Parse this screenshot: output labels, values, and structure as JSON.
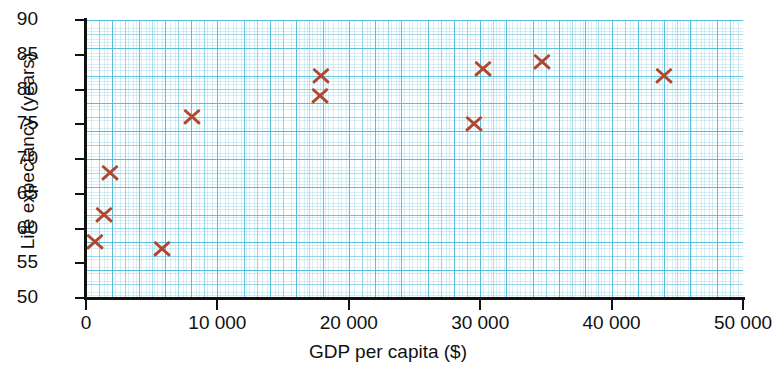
{
  "chart_data": {
    "type": "scatter",
    "title": "",
    "xlabel": "GDP per capita ($)",
    "ylabel": "Life expectancy (years)",
    "xlim": [
      0,
      50000
    ],
    "ylim": [
      50,
      90
    ],
    "xticks": [
      0,
      10000,
      20000,
      30000,
      40000,
      50000
    ],
    "xtick_labels": [
      "0",
      "10 000",
      "20 000",
      "30 000",
      "40 000",
      "50 000"
    ],
    "yticks": [
      50,
      55,
      60,
      65,
      70,
      75,
      80,
      85,
      90
    ],
    "ytick_labels": [
      "50",
      "55",
      "60",
      "65",
      "70",
      "75",
      "80",
      "85",
      "90"
    ],
    "grid": true,
    "grid_style": "graph-paper",
    "legend": null,
    "marker": "x",
    "marker_color": "#b1472f",
    "grid_color": "#6fc3da",
    "axis_color": "#111111",
    "points": [
      {
        "x": 700,
        "y": 58
      },
      {
        "x": 1400,
        "y": 62
      },
      {
        "x": 1800,
        "y": 68
      },
      {
        "x": 5800,
        "y": 57
      },
      {
        "x": 8100,
        "y": 76
      },
      {
        "x": 17800,
        "y": 79
      },
      {
        "x": 17900,
        "y": 82
      },
      {
        "x": 29500,
        "y": 75
      },
      {
        "x": 30200,
        "y": 83
      },
      {
        "x": 34700,
        "y": 84
      },
      {
        "x": 44000,
        "y": 82
      }
    ]
  }
}
